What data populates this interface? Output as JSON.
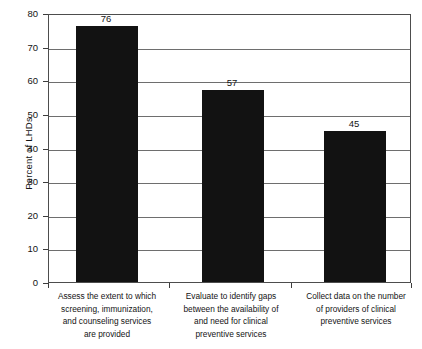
{
  "chart_data": {
    "type": "bar",
    "title": "",
    "xlabel": "",
    "ylabel": "Percent of LHDs",
    "ylim": [
      0,
      80
    ],
    "yticks": [
      0,
      10,
      20,
      30,
      40,
      50,
      60,
      70,
      80
    ],
    "ytick_labels": [
      "0",
      "10",
      "20",
      "30",
      "40",
      "50",
      "60",
      "70",
      "80"
    ],
    "grid": true,
    "legend": null,
    "categories": [
      "Assess the extent to which screening, immunization, and counseling services are provided",
      "Evaluate to identify gaps between the availability of and need for clinical preventive services",
      "Collect data on the number of providers of clinical preventive services"
    ],
    "category_lines": [
      [
        "Assess the extent to which",
        "screening, immunization,",
        "and counseling services",
        "are provided"
      ],
      [
        "Evaluate to identify gaps",
        "between the availability of",
        "and need for clinical",
        "preventive services"
      ],
      [
        "Collect data on the number",
        "of providers of clinical",
        "preventive services"
      ]
    ],
    "values": [
      76,
      57,
      45
    ],
    "value_labels": [
      "76",
      "57",
      "45"
    ],
    "bar_color": "#121212",
    "grid_color": "#6e6e6e",
    "axis_color": "#4d4d4d",
    "background_color": "#ffffff"
  }
}
